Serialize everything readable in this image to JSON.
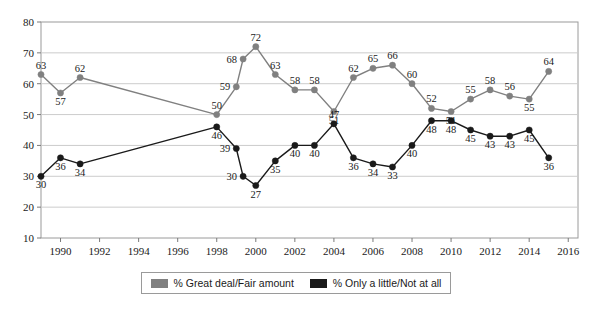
{
  "chart_data": {
    "type": "line",
    "title": "",
    "xlabel": "",
    "ylabel": "",
    "ylim": [
      10,
      80
    ],
    "ytick_step": 10,
    "yticks": [
      10,
      20,
      30,
      40,
      50,
      60,
      70,
      80
    ],
    "xlim": [
      1989,
      2016.5
    ],
    "xticks": [
      1990,
      1992,
      1994,
      1996,
      1998,
      2000,
      2002,
      2004,
      2006,
      2008,
      2010,
      2012,
      2014,
      2016
    ],
    "grid": "horizontal",
    "legend_position": "bottom",
    "markers": true,
    "data_labels": true,
    "x": [
      1989,
      1990,
      1991,
      1998,
      1999,
      1999.35,
      2000,
      2001,
      2002,
      2003,
      2004,
      2005,
      2006,
      2007,
      2008,
      2009,
      2010,
      2011,
      2012,
      2013,
      2014,
      2015,
      2016
    ],
    "series": [
      {
        "name": "% Great deal/Fair amount",
        "color": "#808080",
        "values": [
          63,
          57,
          62,
          50,
          59,
          68,
          72,
          63,
          58,
          58,
          51,
          62,
          65,
          66,
          60,
          52,
          51,
          55,
          58,
          56,
          55,
          64,
          null
        ],
        "label_pos": [
          "above",
          "below",
          "above",
          "above",
          "left",
          "left",
          "above",
          "above",
          "above",
          "above",
          "below",
          "above",
          "above",
          "above",
          "above",
          "above",
          "below",
          "above",
          "above",
          "above",
          "below",
          "above",
          ""
        ]
      },
      {
        "name": "% Only a little/Not at all",
        "color": "#1a1a1a",
        "values": [
          30,
          36,
          34,
          46,
          39,
          30,
          27,
          35,
          40,
          40,
          47,
          36,
          34,
          33,
          40,
          48,
          48,
          45,
          43,
          43,
          45,
          36,
          null
        ],
        "label_pos": [
          "below",
          "below",
          "below",
          "below",
          "left",
          "left",
          "below",
          "below",
          "below",
          "below",
          "above",
          "below",
          "below",
          "below",
          "below",
          "below",
          "below",
          "below",
          "below",
          "below",
          "below",
          "below",
          ""
        ]
      }
    ]
  },
  "legend": {
    "items": [
      {
        "label": "% Great deal/Fair amount",
        "color": "#808080",
        "swatch_name": "legend-swatch-great-deal"
      },
      {
        "label": "% Only a little/Not at all",
        "color": "#1a1a1a",
        "swatch_name": "legend-swatch-only-little"
      }
    ]
  }
}
